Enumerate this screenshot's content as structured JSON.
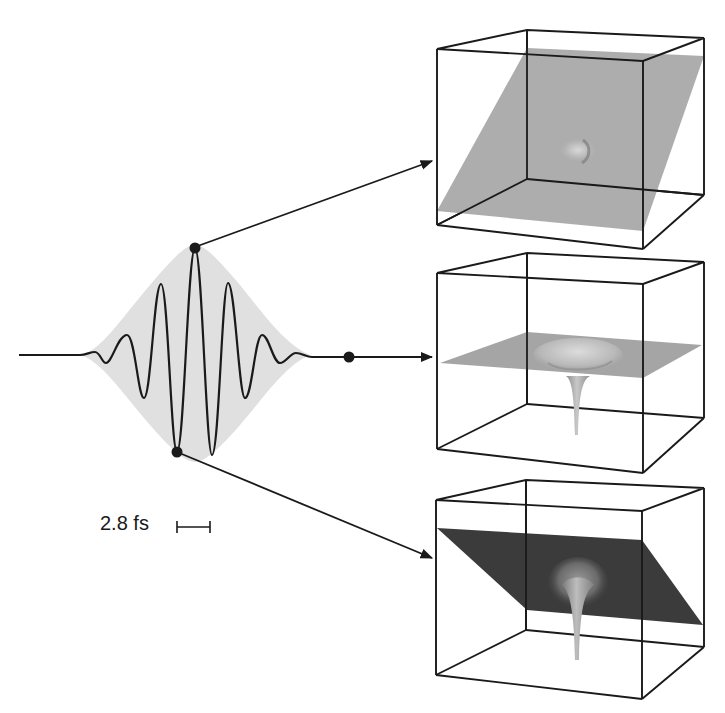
{
  "figure": {
    "scale_bar": {
      "label": "2.8 fs"
    },
    "pulse": {
      "baseline_y": 355,
      "envelope_color": "#e0e0e0",
      "line_color": "#1a1a1a",
      "markers": [
        {
          "name": "field-maximum-marker",
          "target": "panel-top"
        },
        {
          "name": "field-zero-marker",
          "target": "panel-middle"
        },
        {
          "name": "field-minimum-marker",
          "target": "panel-bottom"
        }
      ]
    },
    "panels": [
      {
        "name": "panel-top",
        "description": "Potential tilted by positive field",
        "plane_color": "#a9a9a9"
      },
      {
        "name": "panel-middle",
        "description": "Unperturbed Coulomb potential (zero field)",
        "plane_color": "#a5a5a5"
      },
      {
        "name": "panel-bottom",
        "description": "Potential tilted by negative field",
        "plane_color": "#3b3b3b"
      }
    ],
    "colors": {
      "frame": "#1a1a1a",
      "light_plane": "#a9a9a9",
      "dark_plane": "#3b3b3b",
      "envelope": "#e0e0e0"
    }
  }
}
